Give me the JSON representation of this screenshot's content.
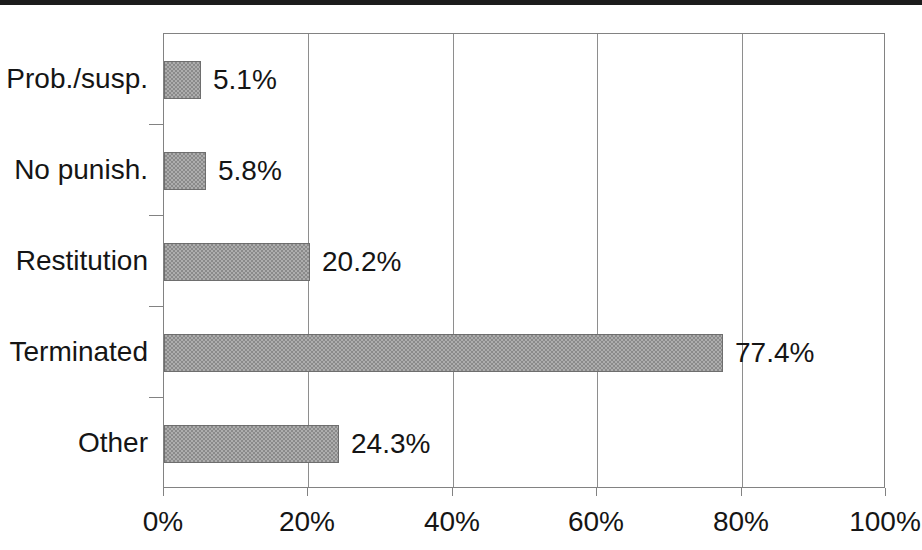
{
  "page": {
    "background": "#ffffff",
    "top_rule_color": "#1c1c1c",
    "text_color": "#151515"
  },
  "chart_data": {
    "type": "bar",
    "orientation": "horizontal",
    "categories": [
      "Prob./susp.",
      "No punish.",
      "Restitution",
      "Terminated",
      "Other"
    ],
    "values": [
      5.1,
      5.8,
      20.2,
      77.4,
      24.3
    ],
    "value_labels": [
      "5.1%",
      "5.8%",
      "20.2%",
      "77.4%",
      "24.3%"
    ],
    "x_tick_values": [
      0,
      20,
      40,
      60,
      80,
      100
    ],
    "x_tick_labels": [
      "0%",
      "20%",
      "40%",
      "60%",
      "80%",
      "100%"
    ],
    "xlim": [
      0,
      100
    ],
    "grid": "vertical-gridlines-at-20-percent-steps",
    "legend": "none",
    "bar_fill_color": "#9b9b9b",
    "bar_pattern": "halftone-checker",
    "bar_border_color": "#6e6e6e",
    "gridline_color": "#8e8e8e",
    "axis_border_color": "#828282"
  }
}
